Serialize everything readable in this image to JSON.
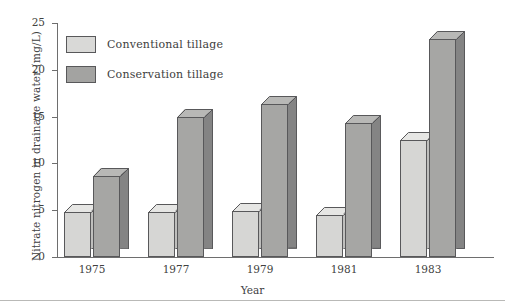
{
  "chart_data": {
    "type": "bar",
    "title": "",
    "subtitle": "",
    "xlabel": "Year",
    "ylabel": "Nitrate nitrogen in drainage water (mg/L)",
    "categories": [
      "1975",
      "1977",
      "1979",
      "1981",
      "1983"
    ],
    "series": [
      {
        "name": "Conventional tillage",
        "color": "#d6d6d4",
        "values": [
          4.8,
          4.8,
          4.9,
          4.5,
          12.5
        ]
      },
      {
        "name": "Conservation tillage",
        "color": "#a6a6a4",
        "values": [
          8.7,
          15.0,
          16.3,
          14.3,
          23.3
        ]
      }
    ],
    "ylim": [
      0,
      25
    ],
    "yticks": [
      0,
      5,
      10,
      15,
      20,
      25
    ],
    "ytick_labels": [
      "0",
      "5",
      "10",
      "15",
      "20",
      "25"
    ],
    "grid": false,
    "legend_position": "upper-left",
    "style": "3d-bars"
  },
  "legend": {
    "entries": [
      {
        "label": "Conventional tillage",
        "swatch": "light"
      },
      {
        "label": "Conservation tillage",
        "swatch": "dark"
      }
    ]
  }
}
